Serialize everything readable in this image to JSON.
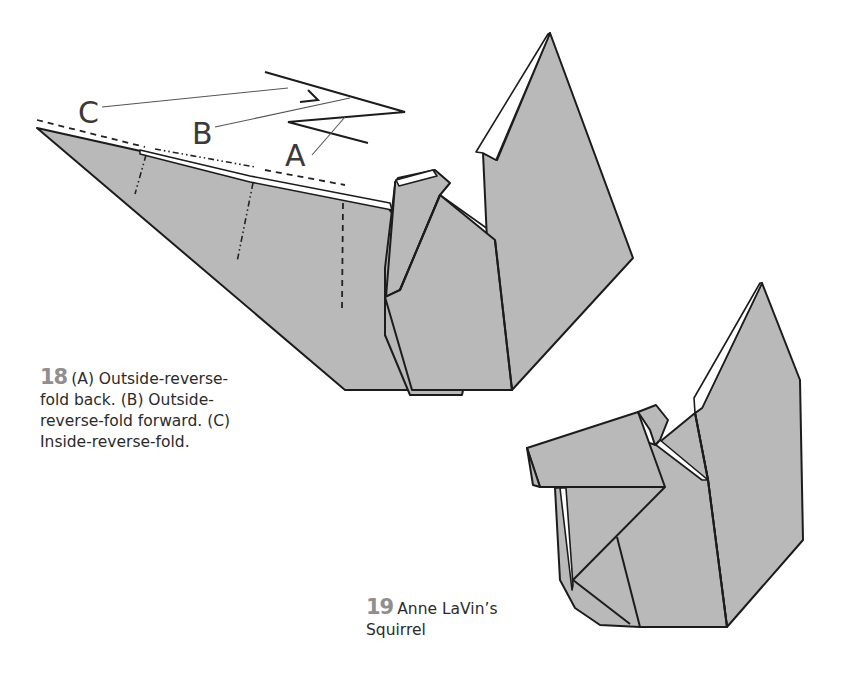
{
  "steps": [
    {
      "number": "18",
      "text": "(A) Outside-reverse-fold back. (B) Outside-reverse-fold forward. (C) Inside-reverse-fold.",
      "lines": [
        "(A) Outside-reverse-",
        "fold back. (B) Outside-",
        "reverse-fold forward. (C)",
        "Inside-reverse-fold."
      ],
      "diagram_labels": [
        "A",
        "B",
        "C"
      ]
    },
    {
      "number": "19",
      "text": "Anne LaVin's Squirrel",
      "lines": [
        "Anne LaVin’s",
        "Squirrel"
      ]
    }
  ],
  "colors": {
    "paper": "#b9b9b9",
    "step_number": "#8f8f8f",
    "text": "#2b2b2b"
  }
}
